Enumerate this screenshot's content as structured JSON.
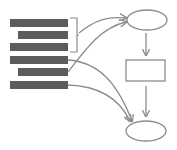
{
  "diagram": {
    "type": "flow",
    "colors": {
      "background": "#ffffff",
      "bar": "#5c5c5c",
      "stroke": "#8c8c8c"
    },
    "bars": [
      {
        "id": "bar-1",
        "x": 10,
        "y": 19,
        "w": 58,
        "h": 8
      },
      {
        "id": "bar-2",
        "x": 18,
        "y": 31,
        "w": 50,
        "h": 8
      },
      {
        "id": "bar-3",
        "x": 10,
        "y": 43,
        "w": 58,
        "h": 8
      },
      {
        "id": "bar-4",
        "x": 10,
        "y": 56,
        "w": 58,
        "h": 8
      },
      {
        "id": "bar-5",
        "x": 18,
        "y": 68,
        "w": 50,
        "h": 8
      },
      {
        "id": "bar-6",
        "x": 10,
        "y": 81,
        "w": 58,
        "h": 8
      }
    ],
    "bracket": {
      "x": 70,
      "y1": 18,
      "y2": 52,
      "tip_x": 79
    },
    "nodes": [
      {
        "id": "top-ellipse",
        "shape": "ellipse",
        "cx": 147,
        "cy": 20,
        "rx": 20,
        "ry": 10
      },
      {
        "id": "middle-rect",
        "shape": "rect",
        "x": 126,
        "y": 60,
        "w": 39,
        "h": 21
      },
      {
        "id": "bottom-ellipse",
        "shape": "ellipse",
        "cx": 146,
        "cy": 131,
        "rx": 20,
        "ry": 10
      }
    ],
    "connectors": [
      {
        "id": "bracket-to-top",
        "from": "bracket",
        "to": "top-ellipse",
        "path": "M79 33 C 95 20, 108 16, 126 18"
      },
      {
        "id": "bar5-to-top",
        "from": "bar-5",
        "to": "top-ellipse",
        "path": "M68 72 C 85 50, 100 28, 126 22"
      },
      {
        "id": "bar4-to-bottom",
        "from": "bar-4",
        "to": "bottom-ellipse",
        "path": "M68 60 C 100 62, 118 85, 132 121"
      },
      {
        "id": "bar6-to-bottom",
        "from": "bar-6",
        "to": "bottom-ellipse",
        "path": "M68 85 C 100 86, 120 100, 130 121"
      },
      {
        "id": "top-to-rect",
        "from": "top-ellipse",
        "to": "middle-rect",
        "path": "M146 33 L146 55"
      },
      {
        "id": "rect-to-bottom",
        "from": "middle-rect",
        "to": "bottom-ellipse",
        "path": "M146 86 L146 116"
      }
    ]
  }
}
